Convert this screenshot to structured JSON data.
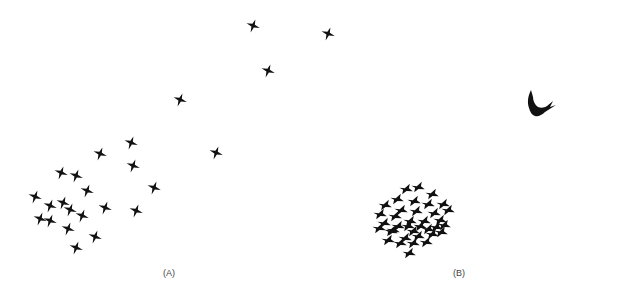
{
  "figure": {
    "panels": [
      {
        "id": "A",
        "label": "(A)",
        "description": "Loose, dispersed flock of starlings in flight (no predator present)",
        "bird_count": 24
      },
      {
        "id": "B",
        "label": "(B)",
        "description": "Tight, compact flock of starlings with a hawk (predator) present",
        "bird_count": 37,
        "predator": "hawk"
      }
    ],
    "colors": {
      "background": "#ffffff",
      "silhouette": "#111111",
      "label": "#444444"
    }
  },
  "panel_a": {
    "label": "(A)",
    "birds": [
      [
        253,
        26
      ],
      [
        328,
        34
      ],
      [
        268,
        71
      ],
      [
        180,
        100
      ],
      [
        131,
        143
      ],
      [
        100,
        154
      ],
      [
        216,
        153
      ],
      [
        133,
        166
      ],
      [
        154,
        188
      ],
      [
        61,
        173
      ],
      [
        76,
        176
      ],
      [
        87,
        191
      ],
      [
        35,
        197
      ],
      [
        63,
        203
      ],
      [
        50,
        206
      ],
      [
        70,
        210
      ],
      [
        105,
        208
      ],
      [
        136,
        211
      ],
      [
        82,
        216
      ],
      [
        40,
        219
      ],
      [
        50,
        221
      ],
      [
        68,
        229
      ],
      [
        95,
        237
      ],
      [
        76,
        248
      ]
    ]
  },
  "panel_b": {
    "label": "(B)",
    "predator_icon": "hawk-silhouette",
    "birds": [
      [
        406,
        189
      ],
      [
        418,
        187
      ],
      [
        432,
        194
      ],
      [
        397,
        199
      ],
      [
        414,
        201
      ],
      [
        428,
        204
      ],
      [
        443,
        204
      ],
      [
        385,
        205
      ],
      [
        401,
        210
      ],
      [
        416,
        211
      ],
      [
        434,
        213
      ],
      [
        448,
        210
      ],
      [
        380,
        214
      ],
      [
        395,
        216
      ],
      [
        410,
        221
      ],
      [
        424,
        221
      ],
      [
        440,
        220
      ],
      [
        384,
        223
      ],
      [
        398,
        226
      ],
      [
        413,
        231
      ],
      [
        428,
        229
      ],
      [
        444,
        225
      ],
      [
        379,
        228
      ],
      [
        391,
        231
      ],
      [
        405,
        238
      ],
      [
        418,
        236
      ],
      [
        432,
        234
      ],
      [
        388,
        240
      ],
      [
        400,
        243
      ],
      [
        413,
        243
      ],
      [
        426,
        242
      ],
      [
        441,
        232
      ],
      [
        393,
        230
      ],
      [
        408,
        226
      ],
      [
        420,
        226
      ],
      [
        436,
        227
      ],
      [
        409,
        253
      ]
    ]
  }
}
